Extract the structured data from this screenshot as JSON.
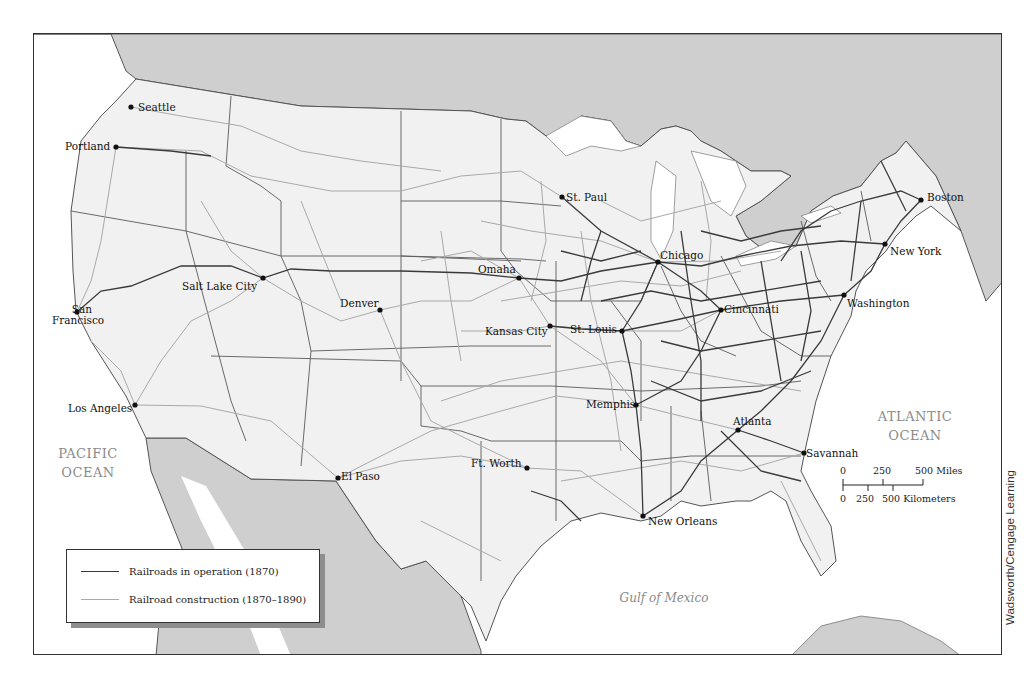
{
  "map": {
    "subject": "U.S. Railroads, 1870–1890",
    "colors": {
      "land_us": "#f1f1f1",
      "land_foreign": "#cfcfcf",
      "water": "#ffffff",
      "rail_1870": "#3a3a3a",
      "rail_1870_1890": "#a9a9a9",
      "border": "#555555",
      "ocean_label": "#8a8a8a"
    },
    "cities": [
      {
        "name": "Seattle",
        "x": 130,
        "y": 106
      },
      {
        "name": "Portland",
        "x": 115,
        "y": 146
      },
      {
        "name": "Salt Lake City",
        "x": 262,
        "y": 277
      },
      {
        "name": "San Francisco",
        "x": 76,
        "y": 311
      },
      {
        "name": "Denver",
        "x": 379,
        "y": 309
      },
      {
        "name": "Los Angeles",
        "x": 134,
        "y": 404
      },
      {
        "name": "El Paso",
        "x": 337,
        "y": 477
      },
      {
        "name": "St. Paul",
        "x": 561,
        "y": 196
      },
      {
        "name": "Omaha",
        "x": 518,
        "y": 277
      },
      {
        "name": "Kansas City",
        "x": 549,
        "y": 325
      },
      {
        "name": "St. Louis",
        "x": 621,
        "y": 330
      },
      {
        "name": "Chicago",
        "x": 657,
        "y": 261
      },
      {
        "name": "Cincinnati",
        "x": 720,
        "y": 309
      },
      {
        "name": "Memphis",
        "x": 635,
        "y": 404
      },
      {
        "name": "Ft. Worth",
        "x": 526,
        "y": 467
      },
      {
        "name": "New Orleans",
        "x": 642,
        "y": 515
      },
      {
        "name": "Atlanta",
        "x": 737,
        "y": 429
      },
      {
        "name": "Savannah",
        "x": 803,
        "y": 452
      },
      {
        "name": "Washington",
        "x": 843,
        "y": 294
      },
      {
        "name": "New York",
        "x": 884,
        "y": 243
      },
      {
        "name": "Boston",
        "x": 920,
        "y": 199
      }
    ],
    "labels": {
      "pacific_1": "PACIFIC",
      "pacific_2": "OCEAN",
      "atlantic_1": "ATLANTIC",
      "atlantic_2": "OCEAN",
      "gulf": "Gulf of Mexico"
    },
    "legend": {
      "items": [
        {
          "label": "Railroads in operation (1870)",
          "style": "dark"
        },
        {
          "label": "Railroad construction (1870–1890)",
          "style": "light"
        }
      ]
    },
    "scale_bar": {
      "miles_ticks": [
        "0",
        "250",
        "500 Miles"
      ],
      "km_ticks": [
        "0",
        "250",
        "500 Kilometers"
      ]
    },
    "credit": "Wadsworth/Cengage Learning"
  }
}
